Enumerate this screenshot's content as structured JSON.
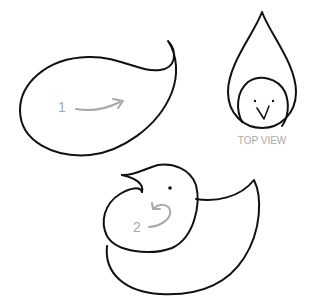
{
  "diagram": {
    "step1": {
      "number": "1",
      "description": "curved arrow pointing right inside teardrop shape"
    },
    "step2": {
      "number": "2",
      "description": "curled arrow inside folded shape with head"
    },
    "top_view": {
      "label": "TOP VIEW"
    },
    "colors": {
      "ink": "#111111",
      "annotation": "#a8a8a8",
      "background": "#ffffff"
    }
  }
}
